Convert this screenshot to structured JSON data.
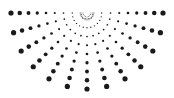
{
  "graphic": {
    "type": "halftone-sunburst",
    "description": "Half sunburst of dotted rays radiating downward from a central point; dots grow larger with distance from center",
    "center": [
      87,
      13
    ],
    "radius": 76,
    "ray_count": 13,
    "angle_start_deg": 0,
    "angle_end_deg": 180,
    "dots_per_ray": 9,
    "min_dot_radius": 0.5,
    "max_dot_radius": 2.6,
    "inner_offset": 6,
    "inner_arcs": [
      {
        "radius": 4,
        "dot_count": 9
      },
      {
        "radius": 7,
        "dot_count": 12
      }
    ],
    "dot_color": "#1a1a1a",
    "background": "#ffffff"
  }
}
